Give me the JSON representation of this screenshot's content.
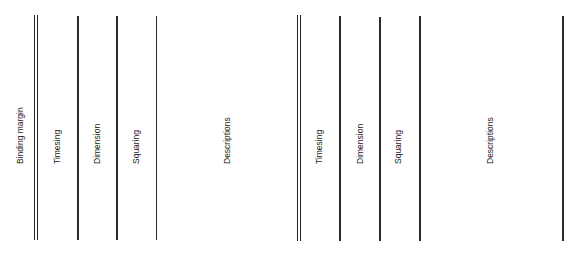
{
  "diagram": {
    "line_color": "#2a2a2a",
    "left_sheet": {
      "columns": [
        {
          "label": "Binding margin",
          "label_x": 15
        },
        {
          "label": "Timesing",
          "label_x": 52
        },
        {
          "label": "Dimension",
          "label_x": 92
        },
        {
          "label": "Squaring",
          "label_x": 131
        },
        {
          "label": "Descriptions",
          "label_x": 222
        }
      ],
      "rules": [
        {
          "x": 34,
          "type": "double"
        },
        {
          "x": 77,
          "type": "single"
        },
        {
          "x": 116,
          "type": "single"
        },
        {
          "x": 156,
          "type": "single"
        }
      ]
    },
    "right_sheet": {
      "columns": [
        {
          "label": "Timesing",
          "label_x": 314
        },
        {
          "label": "Dimension",
          "label_x": 355
        },
        {
          "label": "Squaring",
          "label_x": 393
        },
        {
          "label": "Descriptions",
          "label_x": 485
        }
      ],
      "rules": [
        {
          "x": 297,
          "type": "double"
        },
        {
          "x": 339,
          "type": "single"
        },
        {
          "x": 379,
          "type": "single"
        },
        {
          "x": 419,
          "type": "single"
        },
        {
          "x": 562,
          "type": "single"
        }
      ]
    }
  }
}
